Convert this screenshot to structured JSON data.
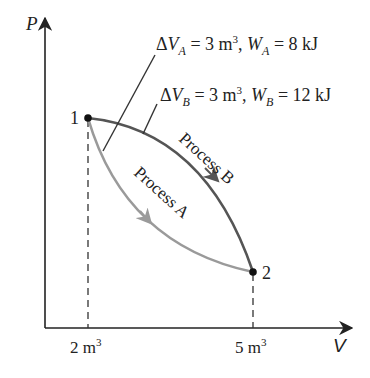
{
  "diagram": {
    "type": "P-V diagram",
    "axes": {
      "y_label": "P",
      "x_label": "V",
      "x_ticks": [
        {
          "value": 2,
          "label_num": "2 m",
          "sup": "3"
        },
        {
          "value": 5,
          "label_num": "5 m",
          "sup": "3"
        }
      ]
    },
    "points": [
      {
        "id": "1",
        "label": "1",
        "V": 2
      },
      {
        "id": "2",
        "label": "2",
        "V": 5
      }
    ],
    "processes": [
      {
        "name": "Process A",
        "label": "Process A",
        "color": "#9a9a9a",
        "from": "1",
        "to": "2",
        "annotation": {
          "delta": "Δ",
          "var": "V",
          "sub": "A",
          "eq1": " = 3 m",
          "sup": "3",
          "sep": ", ",
          "w": "W",
          "wsub": "A",
          "eq2": " = 8 kJ"
        }
      },
      {
        "name": "Process B",
        "label": "Process B",
        "color": "#555555",
        "from": "1",
        "to": "2",
        "annotation": {
          "delta": "Δ",
          "var": "V",
          "sub": "B",
          "eq1": " = 3 m",
          "sup": "3",
          "sep": ", ",
          "w": "W",
          "wsub": "B",
          "eq2": " = 12 kJ"
        }
      }
    ]
  }
}
